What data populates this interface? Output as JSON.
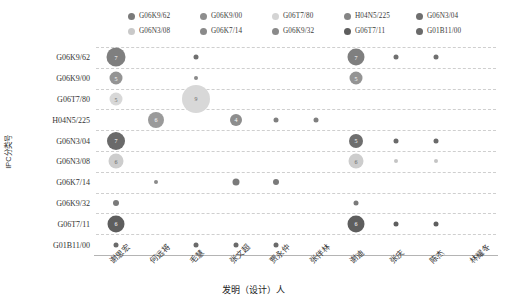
{
  "chart_data": {
    "type": "scatter",
    "title": "",
    "xlabel": "发明（设计）人",
    "ylabel": "IPC分类号",
    "grid": true,
    "legend_position": "top",
    "categories_x": [
      "谢思宏",
      "何远将",
      "毛慧",
      "张文超",
      "贾永仲",
      "张伴林",
      "谢迪",
      "张庆",
      "陈杰",
      "林耀冬"
    ],
    "categories_y": [
      "G06K9/62",
      "G06K9/00",
      "G06T7/80",
      "H04N5/225",
      "G06N3/04",
      "G06N3/08",
      "G06K7/14",
      "G06K9/32",
      "G06T7/11",
      "G01B11/00"
    ],
    "legend": [
      {
        "label": "G06K9/62",
        "color": "#7a7a7a"
      },
      {
        "label": "G06K9/00",
        "color": "#8e8e8e"
      },
      {
        "label": "G06T7/80",
        "color": "#d4d4d4"
      },
      {
        "label": "H04N5/225",
        "color": "#858585"
      },
      {
        "label": "G06N3/04",
        "color": "#6f6f6f"
      },
      {
        "label": "G06N3/08",
        "color": "#c9c9c9"
      },
      {
        "label": "G06K7/14",
        "color": "#8a8a8a"
      },
      {
        "label": "G06K9/32",
        "color": "#8a8a8a"
      },
      {
        "label": "G06T7/11",
        "color": "#5e5e5e"
      },
      {
        "label": "G01B11/00",
        "color": "#6a6a6a"
      }
    ],
    "points": [
      {
        "x": "谢思宏",
        "y": "G06K9/62",
        "value": 7,
        "size": 19,
        "color": "#7f7f7f",
        "show_label": true
      },
      {
        "x": "毛慧",
        "y": "G06K9/62",
        "value": 1,
        "size": 5,
        "color": "#6f6f6f",
        "show_label": false
      },
      {
        "x": "谢迪",
        "y": "G06K9/62",
        "value": 7,
        "size": 17,
        "color": "#7f7f7f",
        "show_label": true
      },
      {
        "x": "张庆",
        "y": "G06K9/62",
        "value": 1,
        "size": 5,
        "color": "#6f6f6f",
        "show_label": false
      },
      {
        "x": "陈杰",
        "y": "G06K9/62",
        "value": 1,
        "size": 5,
        "color": "#6f6f6f",
        "show_label": false
      },
      {
        "x": "谢思宏",
        "y": "G06K9/00",
        "value": 5,
        "size": 13,
        "color": "#949494",
        "show_label": true
      },
      {
        "x": "毛慧",
        "y": "G06K9/00",
        "value": 1,
        "size": 4,
        "color": "#8a8a8a",
        "show_label": false
      },
      {
        "x": "谢迪",
        "y": "G06K9/00",
        "value": 5,
        "size": 13,
        "color": "#949494",
        "show_label": true
      },
      {
        "x": "谢思宏",
        "y": "G06T7/80",
        "value": 5,
        "size": 13,
        "color": "#d8d8d8",
        "show_label": true
      },
      {
        "x": "毛慧",
        "y": "G06T7/80",
        "value": 9,
        "size": 28,
        "color": "#d8d8d8",
        "show_label": true
      },
      {
        "x": "何远将",
        "y": "H04N5/225",
        "value": 6,
        "size": 16,
        "color": "#9a9a9a",
        "show_label": true
      },
      {
        "x": "张文超",
        "y": "H04N5/225",
        "value": 4,
        "size": 12,
        "color": "#8d8d8d",
        "show_label": true
      },
      {
        "x": "贾永仲",
        "y": "H04N5/225",
        "value": 1,
        "size": 5,
        "color": "#7f7f7f",
        "show_label": false
      },
      {
        "x": "张伴林",
        "y": "H04N5/225",
        "value": 1,
        "size": 5,
        "color": "#7f7f7f",
        "show_label": false
      },
      {
        "x": "谢思宏",
        "y": "G06N3/04",
        "value": 7,
        "size": 18,
        "color": "#6a6a6a",
        "show_label": true
      },
      {
        "x": "谢迪",
        "y": "G06N3/04",
        "value": 5,
        "size": 14,
        "color": "#6e6e6e",
        "show_label": true
      },
      {
        "x": "张庆",
        "y": "G06N3/04",
        "value": 1,
        "size": 5,
        "color": "#6a6a6a",
        "show_label": false
      },
      {
        "x": "陈杰",
        "y": "G06N3/04",
        "value": 1,
        "size": 5,
        "color": "#6a6a6a",
        "show_label": false
      },
      {
        "x": "谢思宏",
        "y": "G06N3/08",
        "value": 6,
        "size": 15,
        "color": "#cdcdcd",
        "show_label": true
      },
      {
        "x": "谢迪",
        "y": "G06N3/08",
        "value": 6,
        "size": 15,
        "color": "#cdcdcd",
        "show_label": true
      },
      {
        "x": "张庆",
        "y": "G06N3/08",
        "value": 1,
        "size": 4,
        "color": "#c4c4c4",
        "show_label": false
      },
      {
        "x": "陈杰",
        "y": "G06N3/08",
        "value": 1,
        "size": 4,
        "color": "#c4c4c4",
        "show_label": false
      },
      {
        "x": "何远将",
        "y": "G06K7/14",
        "value": 1,
        "size": 4,
        "color": "#8a8a8a",
        "show_label": false
      },
      {
        "x": "张文超",
        "y": "G06K7/14",
        "value": 2,
        "size": 7,
        "color": "#7a7a7a",
        "show_label": false
      },
      {
        "x": "贾永仲",
        "y": "G06K7/14",
        "value": 2,
        "size": 6,
        "color": "#7a7a7a",
        "show_label": false
      },
      {
        "x": "谢思宏",
        "y": "G06K9/32",
        "value": 2,
        "size": 6,
        "color": "#7a7a7a",
        "show_label": false
      },
      {
        "x": "谢迪",
        "y": "G06K9/32",
        "value": 1,
        "size": 5,
        "color": "#7a7a7a",
        "show_label": false
      },
      {
        "x": "谢思宏",
        "y": "G06T7/11",
        "value": 6,
        "size": 17,
        "color": "#5e5e5e",
        "show_label": true
      },
      {
        "x": "谢迪",
        "y": "G06T7/11",
        "value": 6,
        "size": 17,
        "color": "#5e5e5e",
        "show_label": true
      },
      {
        "x": "张庆",
        "y": "G06T7/11",
        "value": 1,
        "size": 5,
        "color": "#5e5e5e",
        "show_label": false
      },
      {
        "x": "陈杰",
        "y": "G06T7/11",
        "value": 1,
        "size": 5,
        "color": "#5e5e5e",
        "show_label": false
      },
      {
        "x": "谢思宏",
        "y": "G01B11/00",
        "value": 1,
        "size": 5,
        "color": "#6a6a6a",
        "show_label": false
      },
      {
        "x": "毛慧",
        "y": "G01B11/00",
        "value": 1,
        "size": 5,
        "color": "#6a6a6a",
        "show_label": false
      },
      {
        "x": "张文超",
        "y": "G01B11/00",
        "value": 1,
        "size": 5,
        "color": "#6a6a6a",
        "show_label": false
      },
      {
        "x": "贾永仲",
        "y": "G01B11/00",
        "value": 1,
        "size": 5,
        "color": "#6a6a6a",
        "show_label": false
      }
    ]
  }
}
